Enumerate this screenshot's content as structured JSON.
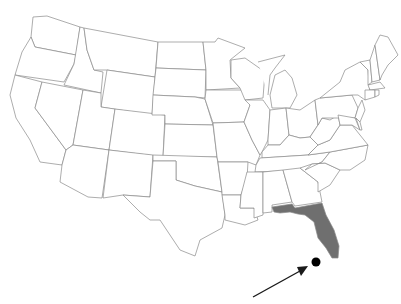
{
  "map": {
    "title": "United States map",
    "highlighted_state": "Florida",
    "highlight_color": "#6f6f6f",
    "border_color": "#8a8a8a",
    "background": "#ffffff",
    "marker": {
      "type": "dot",
      "color": "#000000",
      "x": 316,
      "y": 262,
      "r": 4.5
    },
    "arrow": {
      "color": "#000000",
      "from": [
        253,
        297
      ],
      "to": [
        307,
        267
      ]
    }
  }
}
